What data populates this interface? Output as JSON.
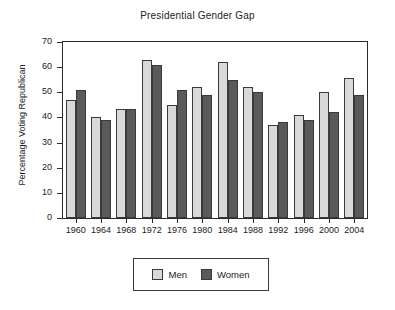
{
  "chart_data": {
    "type": "bar",
    "title": "Presidential Gender Gap",
    "xlabel": "",
    "ylabel": "Percentage Voting Republican",
    "categories": [
      "1960",
      "1964",
      "1968",
      "1972",
      "1976",
      "1980",
      "1984",
      "1988",
      "1992",
      "1996",
      "2000",
      "2004"
    ],
    "series": [
      {
        "name": "Men",
        "color": "#d9d9d9",
        "values": [
          47,
          40,
          43.5,
          63,
          45,
          52,
          62,
          52,
          37,
          41,
          50,
          55.5
        ]
      },
      {
        "name": "Women",
        "color": "#5a5a5a",
        "values": [
          51,
          39,
          43.5,
          61,
          51,
          49,
          55,
          50,
          38,
          39,
          42,
          49
        ]
      }
    ],
    "ylim": [
      0,
      70
    ],
    "yticks": [
      0,
      10,
      20,
      30,
      40,
      50,
      60,
      70
    ],
    "ytick_labels": [
      "0",
      "10",
      "20",
      "30",
      "40",
      "50",
      "60",
      "70"
    ],
    "grid": false,
    "legend_position": "below-center",
    "legend_entries": [
      "Men",
      "Women"
    ],
    "bar_outline_color": "#3a3a3a",
    "axis_color": "#2b2b2b"
  }
}
